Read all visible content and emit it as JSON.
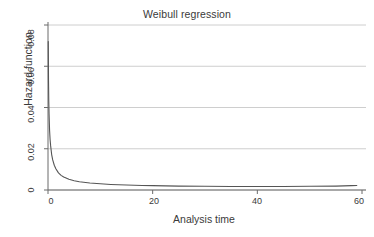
{
  "chart_data": {
    "type": "line",
    "title": "Weibull regression",
    "xlabel": "Analysis time",
    "ylabel": "Hazard function",
    "xlim": [
      0,
      60
    ],
    "ylim": [
      0,
      0.08
    ],
    "grid": true,
    "legend": "none",
    "xticks": [
      0,
      20,
      40,
      60
    ],
    "xtick_labels": [
      "0",
      "20",
      "40",
      "60"
    ],
    "yticks": [
      0,
      0.02,
      0.04,
      0.06,
      0.08
    ],
    "ytick_labels": [
      "0",
      "0.02",
      "0.04",
      "0.06",
      "0.08"
    ],
    "series": [
      {
        "name": "hazard",
        "color": "#555555",
        "x": [
          0.05,
          0.1,
          0.15,
          0.2,
          0.3,
          0.4,
          0.5,
          0.7,
          0.9,
          1.2,
          1.5,
          2,
          2.5,
          3,
          4,
          5,
          6,
          8,
          10,
          12,
          15,
          18,
          20,
          25,
          30,
          35,
          40,
          45,
          50,
          55,
          58,
          59
        ],
        "y": [
          0.072,
          0.053,
          0.043,
          0.037,
          0.029,
          0.0245,
          0.0215,
          0.0172,
          0.0146,
          0.012,
          0.0103,
          0.0083,
          0.0071,
          0.0063,
          0.0052,
          0.0045,
          0.004,
          0.0034,
          0.003,
          0.0027,
          0.0024,
          0.0022,
          0.0021,
          0.0019,
          0.0018,
          0.0017,
          0.0017,
          0.0017,
          0.0018,
          0.0019,
          0.0021,
          0.0022
        ]
      }
    ]
  },
  "axes": {
    "title": "Weibull regression",
    "x_title": "Analysis time",
    "y_title": "Hazard function",
    "x_labels": [
      "0",
      "20",
      "40",
      "60"
    ],
    "y_labels": [
      "0",
      "0.02",
      "0.04",
      "0.06",
      "0.08"
    ]
  },
  "colors": {
    "curve": "#555555",
    "grid": "#c8c8c8",
    "axis": "#6b6b6b",
    "text": "#3a3a3a",
    "background": "#ffffff"
  }
}
